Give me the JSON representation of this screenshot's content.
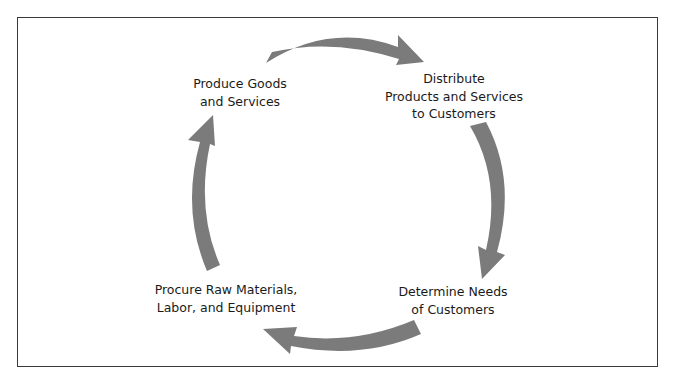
{
  "diagram": {
    "type": "cycle",
    "colors": {
      "arrow": "#7b7b7b",
      "border": "#3a3a3a",
      "text": "#1a1a1a",
      "background": "#ffffff"
    },
    "nodes": [
      {
        "id": "produce",
        "lines": [
          "Produce Goods",
          "and Services"
        ]
      },
      {
        "id": "distribute",
        "lines": [
          "Distribute",
          "Products and Services",
          "to Customers"
        ]
      },
      {
        "id": "determine",
        "lines": [
          "Determine Needs",
          "of Customers"
        ]
      },
      {
        "id": "procure",
        "lines": [
          "Procure Raw Materials,",
          "Labor, and Equipment"
        ]
      }
    ],
    "edges": [
      {
        "from": "produce",
        "to": "distribute"
      },
      {
        "from": "distribute",
        "to": "determine"
      },
      {
        "from": "determine",
        "to": "procure"
      },
      {
        "from": "procure",
        "to": "produce"
      }
    ]
  }
}
